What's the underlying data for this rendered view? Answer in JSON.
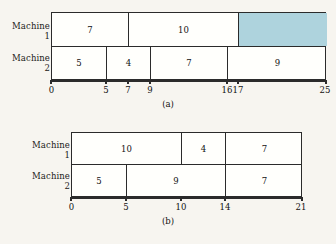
{
  "page": {
    "background_color": "#f7f5f0",
    "ink_color": "#2b2b2b",
    "idle_fill_color": "#aed3dd"
  },
  "figures": [
    {
      "id": "a",
      "caption": "(a)",
      "row_labels": [
        {
          "line1": "Machine",
          "line2": "1"
        },
        {
          "line1": "Machine",
          "line2": "2"
        }
      ],
      "axis": {
        "min": 0,
        "max": 25,
        "ticks": [
          0,
          5,
          7,
          9,
          16,
          17,
          25
        ],
        "tick_labels": [
          "0",
          "5",
          "7",
          "9",
          "16",
          "17",
          "25"
        ]
      },
      "rows": [
        {
          "machine": "Machine 1",
          "blocks": [
            {
              "label": "7",
              "start": 0,
              "end": 7,
              "idle": false
            },
            {
              "label": "10",
              "start": 7,
              "end": 17,
              "idle": false
            },
            {
              "label": "",
              "start": 17,
              "end": 25,
              "idle": true
            }
          ]
        },
        {
          "machine": "Machine 2",
          "blocks": [
            {
              "label": "5",
              "start": 0,
              "end": 5,
              "idle": false
            },
            {
              "label": "4",
              "start": 5,
              "end": 9,
              "idle": false
            },
            {
              "label": "7",
              "start": 9,
              "end": 16,
              "idle": false
            },
            {
              "label": "9",
              "start": 16,
              "end": 25,
              "idle": false
            }
          ]
        }
      ]
    },
    {
      "id": "b",
      "caption": "(b)",
      "row_labels": [
        {
          "line1": "Machine",
          "line2": "1"
        },
        {
          "line1": "Machine",
          "line2": "2"
        }
      ],
      "axis": {
        "min": 0,
        "max": 21,
        "ticks": [
          0,
          5,
          10,
          14,
          21
        ],
        "tick_labels": [
          "0",
          "5",
          "10",
          "14",
          "21"
        ]
      },
      "rows": [
        {
          "machine": "Machine 1",
          "blocks": [
            {
              "label": "10",
              "start": 0,
              "end": 10,
              "idle": false
            },
            {
              "label": "4",
              "start": 10,
              "end": 14,
              "idle": false
            },
            {
              "label": "7",
              "start": 14,
              "end": 21,
              "idle": false
            }
          ]
        },
        {
          "machine": "Machine 2",
          "blocks": [
            {
              "label": "5",
              "start": 0,
              "end": 5,
              "idle": false
            },
            {
              "label": "9",
              "start": 5,
              "end": 14,
              "idle": false
            },
            {
              "label": "7",
              "start": 14,
              "end": 21,
              "idle": false
            }
          ]
        }
      ]
    }
  ],
  "chart_data": {
    "type": "bar",
    "subtype": "gantt",
    "title": "",
    "xlabel": "",
    "ylabel": "",
    "charts": [
      {
        "name": "(a)",
        "xlim": [
          0,
          25
        ],
        "xticks": [
          0,
          5,
          7,
          9,
          16,
          17,
          25
        ],
        "grid": false,
        "legend": "none",
        "categories": [
          "Machine 1",
          "Machine 2"
        ],
        "series": [
          {
            "name": "Machine 1",
            "bars": [
              {
                "start": 0,
                "end": 7,
                "duration": 7,
                "label": "7",
                "idle": false
              },
              {
                "start": 7,
                "end": 17,
                "duration": 10,
                "label": "10",
                "idle": false
              },
              {
                "start": 17,
                "end": 25,
                "duration": 8,
                "label": "",
                "idle": true
              }
            ]
          },
          {
            "name": "Machine 2",
            "bars": [
              {
                "start": 0,
                "end": 5,
                "duration": 5,
                "label": "5",
                "idle": false
              },
              {
                "start": 5,
                "end": 9,
                "duration": 4,
                "label": "4",
                "idle": false
              },
              {
                "start": 9,
                "end": 16,
                "duration": 7,
                "label": "7",
                "idle": false
              },
              {
                "start": 16,
                "end": 25,
                "duration": 9,
                "label": "9",
                "idle": false
              }
            ]
          }
        ]
      },
      {
        "name": "(b)",
        "xlim": [
          0,
          21
        ],
        "xticks": [
          0,
          5,
          10,
          14,
          21
        ],
        "grid": false,
        "legend": "none",
        "categories": [
          "Machine 1",
          "Machine 2"
        ],
        "series": [
          {
            "name": "Machine 1",
            "bars": [
              {
                "start": 0,
                "end": 10,
                "duration": 10,
                "label": "10",
                "idle": false
              },
              {
                "start": 10,
                "end": 14,
                "duration": 4,
                "label": "4",
                "idle": false
              },
              {
                "start": 14,
                "end": 21,
                "duration": 7,
                "label": "7",
                "idle": false
              }
            ]
          },
          {
            "name": "Machine 2",
            "bars": [
              {
                "start": 0,
                "end": 5,
                "duration": 5,
                "label": "5",
                "idle": false
              },
              {
                "start": 5,
                "end": 14,
                "duration": 9,
                "label": "9",
                "idle": false
              },
              {
                "start": 14,
                "end": 21,
                "duration": 7,
                "label": "7",
                "idle": false
              }
            ]
          }
        ]
      }
    ]
  }
}
